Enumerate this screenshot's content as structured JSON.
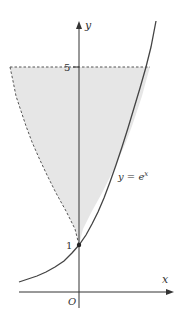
{
  "diagram": {
    "axes": {
      "x_label": "x",
      "y_label": "y",
      "origin_label": "O"
    },
    "ticks": {
      "y_5": "5",
      "y_1": "1"
    },
    "curve_label": "y = e",
    "curve_label_exp": "x",
    "colors": {
      "shade": "#e6e6e6",
      "curve": "#444444",
      "axis": "#333333"
    }
  }
}
